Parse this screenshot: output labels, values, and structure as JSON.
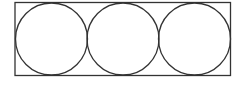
{
  "diagram": {
    "rectangle": {
      "x": 15,
      "y": 2.5,
      "width": 215.5,
      "height": 73,
      "stroke": "#333333"
    },
    "circles": [
      {
        "cx": 51.5,
        "cy": 39,
        "r": 36
      },
      {
        "cx": 123,
        "cy": 39,
        "r": 36
      },
      {
        "cx": 194.5,
        "cy": 39,
        "r": 36
      }
    ],
    "stroke_color": "#333333",
    "stroke_width": 1.3
  }
}
